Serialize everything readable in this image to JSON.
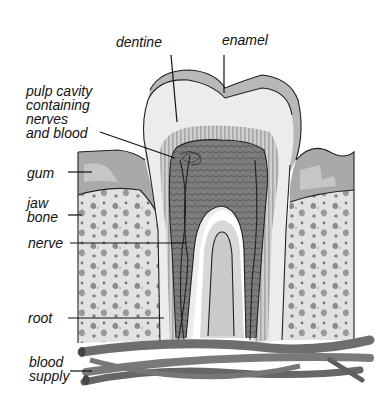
{
  "diagram": {
    "colors": {
      "background": "#ffffff",
      "enamel": "#b8b8b8",
      "dentine": "#e6e6e6",
      "dentine_striations": "#a8a8a8",
      "pulp": "#7a7a7a",
      "gum": "#a9a9a9",
      "bone": "#e2e2e2",
      "bone_spots": "#8a8a8a",
      "blood_vessels": "#6e6e6e",
      "outline": "#222222"
    },
    "labels": [
      {
        "id": "dentine",
        "text": "dentine"
      },
      {
        "id": "enamel",
        "text": "enamel"
      },
      {
        "id": "pulp_cavity",
        "text": "pulp cavity\ncontaining\nnerves\nand blood"
      },
      {
        "id": "gum",
        "text": "gum"
      },
      {
        "id": "jaw_bone",
        "text": "jaw\nbone"
      },
      {
        "id": "nerve",
        "text": "nerve"
      },
      {
        "id": "root",
        "text": "root"
      },
      {
        "id": "blood_supply",
        "text": "blood\nsupply"
      }
    ]
  }
}
